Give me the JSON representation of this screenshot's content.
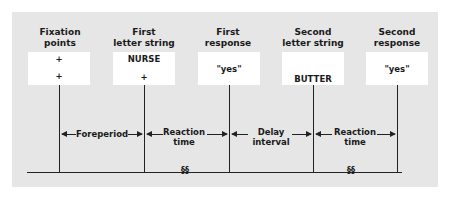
{
  "diagram": {
    "columns": [
      {
        "title_line1": "Fixation",
        "title_line2": "points",
        "box_top": "+",
        "box_bottom": "+"
      },
      {
        "title_line1": "First",
        "title_line2": "letter string",
        "box_top": "NURSE",
        "box_bottom": "+"
      },
      {
        "title_line1": "First",
        "title_line2": "response",
        "box_top": "",
        "box_bottom": "\"yes\""
      },
      {
        "title_line1": "Second",
        "title_line2": "letter string",
        "box_top": "",
        "box_bottom": "BUTTER"
      },
      {
        "title_line1": "Second",
        "title_line2": "response",
        "box_top": "",
        "box_bottom": "\"yes\""
      }
    ],
    "intervals": [
      {
        "line1": "Foreperiod",
        "line2": ""
      },
      {
        "line1": "Reaction",
        "line2": "time"
      },
      {
        "line1": "Delay",
        "line2": "interval"
      },
      {
        "line1": "Reaction",
        "line2": "time"
      }
    ],
    "break_symbol": "§§",
    "colors": {
      "panel": "#e6e6e6",
      "box": "#ffffff",
      "line": "#222222"
    }
  }
}
